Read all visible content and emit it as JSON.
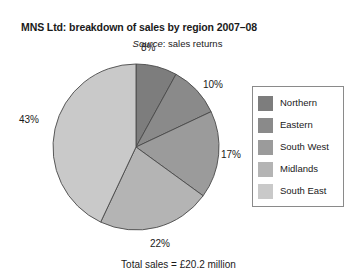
{
  "header": {
    "title": "MNS Ltd: breakdown of sales by region 2007–08",
    "source_word": "Source",
    "source_rest": ": sales returns"
  },
  "footer": {
    "total_caption": "Total sales = £20.2 million"
  },
  "legend": {
    "items": [
      {
        "label": "Northern",
        "color": "#7d7d7d"
      },
      {
        "label": "Eastern",
        "color": "#8a8a8a"
      },
      {
        "label": "South West",
        "color": "#9b9b9b"
      },
      {
        "label": "Midlands",
        "color": "#b4b4b4"
      },
      {
        "label": "South East",
        "color": "#c9c9c9"
      }
    ]
  },
  "labels": {
    "percents": [
      "8%",
      "10%",
      "17%",
      "22%",
      "43%"
    ]
  },
  "chart_data": {
    "type": "pie",
    "title": "MNS Ltd: breakdown of sales by region 2007–08",
    "subtitle": "Source: sales returns",
    "footnote": "Total sales = £20.2 million",
    "total_sales": "£20.2 million",
    "unit": "percent",
    "categories": [
      "Northern",
      "Eastern",
      "South West",
      "Midlands",
      "South East"
    ],
    "values": [
      8,
      10,
      17,
      22,
      43
    ],
    "data_labels": [
      "8%",
      "10%",
      "17%",
      "22%",
      "43%"
    ],
    "colors": [
      "#7d7d7d",
      "#8a8a8a",
      "#9b9b9b",
      "#b4b4b4",
      "#c9c9c9"
    ],
    "start_angle_deg": 0,
    "direction": "clockwise",
    "legend_position": "right",
    "grid": false,
    "slice_border_color": "#4a4a4a"
  },
  "geometry": {
    "cx": 84,
    "cy": 84,
    "r": 83
  }
}
